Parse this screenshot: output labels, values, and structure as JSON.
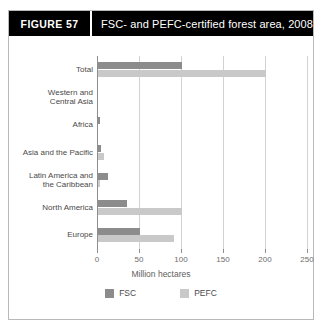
{
  "figure": {
    "tag_label": "FIGURE  57",
    "title": "FSC- and PEFC-certified forest area, 2008"
  },
  "chart_data": {
    "type": "bar",
    "orientation": "horizontal",
    "title": "FSC- and PEFC-certified forest area, 2008",
    "xlabel": "Million hectares",
    "ylabel": "",
    "xlim": [
      0,
      250
    ],
    "xticks": [
      0,
      50,
      100,
      150,
      200,
      250
    ],
    "xtick_labels": [
      "0",
      "50",
      "100",
      "150",
      "200",
      "250"
    ],
    "grid": true,
    "legend_position": "bottom",
    "categories": [
      "Total",
      "Western and\nCentral Asia",
      "Africa",
      "Asia and the Pacific",
      "Latin America and\nthe Caribbean",
      "North America",
      "Europe"
    ],
    "category_labels": [
      [
        "Total"
      ],
      [
        "Western and",
        "Central Asia"
      ],
      [
        "Africa"
      ],
      [
        "Asia and the Pacific"
      ],
      [
        "Latin America and",
        "the Caribbean"
      ],
      [
        "North America"
      ],
      [
        "Europe"
      ]
    ],
    "series": [
      {
        "name": "FSC",
        "color": "#8c8c8c",
        "values": [
          100,
          0,
          2,
          3,
          12,
          35,
          50
        ]
      },
      {
        "name": "PEFC",
        "color": "#c9c9c9",
        "values": [
          200,
          0,
          0,
          7,
          2,
          100,
          90
        ]
      }
    ]
  },
  "legend": [
    {
      "label": "FSC",
      "color": "#8c8c8c"
    },
    {
      "label": "PEFC",
      "color": "#c9c9c9"
    }
  ]
}
